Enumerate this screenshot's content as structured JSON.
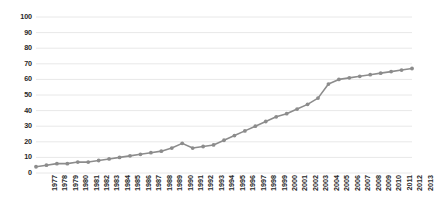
{
  "chart_data": {
    "type": "line",
    "title": "",
    "subtitle": "",
    "xlabel": "",
    "ylabel": "",
    "xlim": [
      1977,
      2013
    ],
    "ylim": [
      0,
      100
    ],
    "ytick_step": 10,
    "grid": true,
    "grid_axis": "y",
    "legend": false,
    "legend_position": "none",
    "marker": "circle",
    "series_color": "#8c8c8c",
    "categories": [
      "1977",
      "1978",
      "1979",
      "1980",
      "1981",
      "1982",
      "1983",
      "1984",
      "1985",
      "1986",
      "1987",
      "1988",
      "1989",
      "1990",
      "1991",
      "1992",
      "1993",
      "1994",
      "1995",
      "1996",
      "1997",
      "1998",
      "1999",
      "2000",
      "2001",
      "2002",
      "2003",
      "2004",
      "2005",
      "2006",
      "2007",
      "2008",
      "2009",
      "2010",
      "2011",
      "2012",
      "2013"
    ],
    "values": [
      4,
      5,
      6,
      6,
      7,
      7,
      8,
      9,
      10,
      11,
      12,
      13,
      14,
      16,
      19,
      16,
      17,
      18,
      21,
      24,
      27,
      30,
      33,
      36,
      38,
      41,
      44,
      48,
      57,
      60,
      61,
      62,
      63,
      64,
      65,
      66,
      67
    ],
    "yticks": [
      {
        "label": "0",
        "value": 0
      },
      {
        "label": "10",
        "value": 10
      },
      {
        "label": "20",
        "value": 20
      },
      {
        "label": "30",
        "value": 30
      },
      {
        "label": "40",
        "value": 40
      },
      {
        "label": "50",
        "value": 50
      },
      {
        "label": "60",
        "value": 60
      },
      {
        "label": "70",
        "value": 70
      },
      {
        "label": "80",
        "value": 80
      },
      {
        "label": "90",
        "value": 90
      },
      {
        "label": "100",
        "value": 100
      }
    ]
  },
  "colors": {
    "series": "#8c8c8c",
    "grid": "#e8e8e8",
    "axis_text": "#262626",
    "background": "#ffffff"
  }
}
